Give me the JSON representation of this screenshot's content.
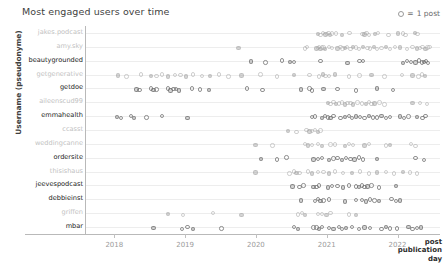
{
  "chart": {
    "title": "Most engaged users over time",
    "ylabel": "Username (pseudonyme)",
    "xtitle_line1": "post",
    "xtitle_line2": "publication",
    "xtitle_line3": "day",
    "legend_symbol": "=",
    "legend_label": "1 post"
  },
  "chart_data": {
    "type": "scatter",
    "title": "Most engaged users over time",
    "xlabel": "post publication day",
    "ylabel": "Username (pseudonyme)",
    "xlim": [
      2017.6,
      2022.6
    ],
    "grid": true,
    "legend": "○ = 1 post",
    "legend_position": "top-right",
    "xticks": [
      "2018",
      "2019",
      "2020",
      "2021",
      "2022"
    ],
    "xtick_values": [
      2018,
      2019,
      2020,
      2021,
      2022
    ],
    "categories": [
      "jakes.podcast",
      "amy.sky",
      "beautygrounded",
      "getgenerative",
      "getdoe",
      "aileenscud99",
      "emmahealth",
      "ccasst",
      "weddingcanne",
      "ordersite",
      "thisishaus",
      "jeevespodcast",
      "debbieinst",
      "griffen",
      "mbar"
    ],
    "series": [
      {
        "name": "jakes.podcast",
        "label_style": "light",
        "x": [
          2020.86,
          2020.9,
          2020.93,
          2020.97,
          2020.99,
          2021.01,
          2021.03,
          2021.06,
          2021.12,
          2021.2,
          2021.31,
          2021.49,
          2021.52,
          2021.55,
          2021.58,
          2021.67,
          2021.71,
          2021.86,
          2021.99,
          2022.06,
          2022.1,
          2022.23,
          2022.27
        ]
      },
      {
        "name": "amy.sky",
        "label_style": "light",
        "x": [
          2019.74,
          2020.68,
          2020.71,
          2020.84,
          2020.86,
          2020.88,
          2020.9,
          2020.92,
          2020.94,
          2020.96,
          2021.02,
          2021.06,
          2021.14,
          2021.18,
          2021.21,
          2021.24,
          2021.27,
          2021.32,
          2021.36,
          2021.4,
          2021.44,
          2021.5,
          2021.56,
          2021.6,
          2021.65,
          2021.7,
          2021.76,
          2021.82,
          2021.88,
          2021.95,
          2022.02,
          2022.12,
          2022.2,
          2022.26,
          2022.3,
          2022.34,
          2022.38,
          2022.41,
          2022.44
        ]
      },
      {
        "name": "beautygrounded",
        "label_style": "dark",
        "x": [
          2019.92,
          2020.12,
          2020.35,
          2020.47,
          2020.52,
          2020.9,
          2021.28,
          2021.45,
          2021.5,
          2022.06,
          2022.12,
          2022.18,
          2022.24,
          2022.29,
          2022.33,
          2022.36,
          2022.39,
          2022.42
        ]
      },
      {
        "name": "getgenerative",
        "label_style": "light",
        "x": [
          2018.04,
          2018.16,
          2018.36,
          2018.5,
          2018.58,
          2018.66,
          2018.74,
          2018.84,
          2018.92,
          2019.0,
          2019.1,
          2019.22,
          2019.34,
          2019.46,
          2019.6,
          2019.78,
          2020.05,
          2020.28,
          2020.52,
          2020.74,
          2020.88,
          2020.93,
          2020.97,
          2021.02,
          2021.1,
          2021.3,
          2021.45,
          2021.62,
          2021.8,
          2022.05,
          2022.2,
          2022.28,
          2022.33,
          2022.37
        ]
      },
      {
        "name": "getdoe",
        "label_style": "dark",
        "x": [
          2018.3,
          2018.34,
          2018.5,
          2018.54,
          2018.58,
          2018.74,
          2018.78,
          2018.82,
          2018.86,
          2018.9,
          2019.08,
          2019.2,
          2019.32,
          2019.86,
          2020.08,
          2020.62,
          2020.74,
          2020.78,
          2020.94,
          2021.14,
          2021.4,
          2021.7,
          2021.92
        ]
      },
      {
        "name": "aileenscud99",
        "label_style": "light",
        "x": [
          2021.0,
          2021.04,
          2021.08,
          2021.12,
          2021.16,
          2021.2,
          2021.24,
          2021.28,
          2021.32,
          2021.36,
          2021.42,
          2021.48,
          2021.54,
          2021.58,
          2021.62,
          2021.66,
          2021.73,
          2021.8,
          2022.2,
          2022.3,
          2022.4
        ]
      },
      {
        "name": "emmahealth",
        "label_style": "dark",
        "x": [
          2018.02,
          2018.08,
          2018.22,
          2018.26,
          2018.44,
          2018.66,
          2019.02,
          2020.78,
          2020.82,
          2020.92,
          2020.96,
          2021.0,
          2021.04,
          2021.08,
          2021.18,
          2021.24,
          2021.3,
          2021.34,
          2021.4,
          2021.46,
          2021.52,
          2021.58,
          2021.64,
          2021.7,
          2021.76,
          2021.82,
          2021.88,
          2022.02,
          2022.08,
          2022.14,
          2022.26,
          2022.34,
          2022.38
        ]
      },
      {
        "name": "ccasst",
        "label_style": "light",
        "x": [
          2020.44,
          2020.56,
          2020.7,
          2020.74,
          2020.78,
          2020.82,
          2020.86,
          2020.9
        ]
      },
      {
        "name": "weddingcanne",
        "label_style": "light",
        "x": [
          2019.98,
          2020.22,
          2020.68,
          2020.72,
          2020.78,
          2020.86,
          2020.92,
          2021.04,
          2021.1,
          2021.24,
          2021.3,
          2021.36,
          2021.52,
          2021.58,
          2021.82,
          2021.88,
          2022.18,
          2022.24
        ]
      },
      {
        "name": "ordersite",
        "label_style": "dark",
        "x": [
          2020.06,
          2020.28,
          2020.42,
          2020.8,
          2020.86,
          2020.92,
          2021.02,
          2021.08,
          2021.14,
          2021.2,
          2021.26,
          2021.32,
          2021.38,
          2021.44,
          2021.5,
          2021.7,
          2022.24,
          2022.36
        ]
      },
      {
        "name": "thisishaus",
        "label_style": "light",
        "x": [
          2019.98,
          2020.46,
          2020.52,
          2020.56,
          2020.6,
          2020.72,
          2020.78,
          2020.86,
          2020.94,
          2021.02,
          2021.1,
          2021.22,
          2021.34,
          2021.46,
          2021.58,
          2021.7,
          2021.82,
          2021.94,
          2022.06,
          2022.16,
          2022.26
        ]
      },
      {
        "name": "jeevespodcast",
        "label_style": "dark",
        "x": [
          2020.5,
          2020.6,
          2020.66,
          2020.8,
          2020.84,
          2020.88,
          2021.0,
          2021.06,
          2021.14,
          2021.22,
          2021.3,
          2021.4,
          2021.44,
          2021.48,
          2021.52,
          2021.56,
          2021.62,
          2021.72,
          2021.96
        ]
      },
      {
        "name": "debbieinst",
        "label_style": "dark",
        "x": [
          2020.62,
          2020.82,
          2020.86,
          2020.9,
          2020.94,
          2021.02,
          2021.24,
          2021.4,
          2021.48,
          2021.54,
          2021.6,
          2021.66,
          2021.72,
          2021.9,
          2021.96,
          2022.02
        ]
      },
      {
        "name": "griffen",
        "label_style": "light",
        "x": [
          2018.74,
          2018.96,
          2019.38,
          2019.78,
          2020.58,
          2020.64,
          2020.68,
          2020.86,
          2020.92,
          2020.98,
          2021.04,
          2021.3,
          2021.4
        ]
      },
      {
        "name": "mbar",
        "label_style": "dark",
        "x": [
          2018.54,
          2018.94,
          2019.02,
          2019.1,
          2019.5,
          2020.52,
          2020.58,
          2020.8,
          2020.84,
          2020.88,
          2020.92,
          2021.02,
          2021.08,
          2021.16,
          2021.2,
          2021.26,
          2021.34,
          2021.44,
          2021.52,
          2021.6,
          2021.76,
          2021.82,
          2021.88,
          2021.98,
          2022.14,
          2022.2,
          2022.26,
          2022.32
        ]
      }
    ]
  }
}
